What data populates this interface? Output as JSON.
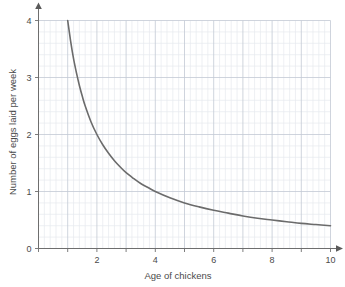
{
  "chart_data": {
    "type": "line",
    "title": "",
    "xlabel": "Age of chickens",
    "ylabel": "Number of eggs laid per week",
    "xlim": [
      0,
      10
    ],
    "ylim": [
      0,
      4
    ],
    "xticks": [
      2,
      4,
      6,
      8,
      10
    ],
    "yticks": [
      0,
      1,
      2,
      3,
      4
    ],
    "xtick_labels": [
      "2",
      "4",
      "6",
      "8",
      "10"
    ],
    "ytick_labels": [
      "0",
      "1",
      "2",
      "3",
      "4"
    ],
    "grid": true,
    "grid_minor": true,
    "minor_divisions_per_major": 5,
    "legend": null,
    "relationship": "y = 4 / x (inverse proportion)",
    "series": [
      {
        "name": "Eggs per week vs age",
        "color": "#6b6b6b",
        "x": [
          1.0,
          1.1,
          1.2,
          1.3,
          1.4,
          1.5,
          1.6,
          1.8,
          2.0,
          2.2,
          2.4,
          2.6,
          2.8,
          3.0,
          3.25,
          3.5,
          3.75,
          4.0,
          4.5,
          5.0,
          5.5,
          6.0,
          6.5,
          7.0,
          7.5,
          8.0,
          8.5,
          9.0,
          9.5,
          10.0
        ],
        "y": [
          4.0,
          3.64,
          3.33,
          3.08,
          2.86,
          2.67,
          2.5,
          2.22,
          2.0,
          1.82,
          1.67,
          1.54,
          1.43,
          1.33,
          1.23,
          1.14,
          1.07,
          1.0,
          0.89,
          0.8,
          0.73,
          0.67,
          0.62,
          0.57,
          0.53,
          0.5,
          0.47,
          0.44,
          0.42,
          0.4
        ]
      }
    ]
  },
  "colors": {
    "curve": "#6b6b6b",
    "axis": "#6e6e6e",
    "grid_major": "#c3c9d4",
    "grid_minor": "#e6e9ef",
    "text": "#4a4a4a",
    "background": "#ffffff"
  },
  "axes": {
    "x_arrow": "arrow-right",
    "y_arrow": "arrow-up"
  }
}
